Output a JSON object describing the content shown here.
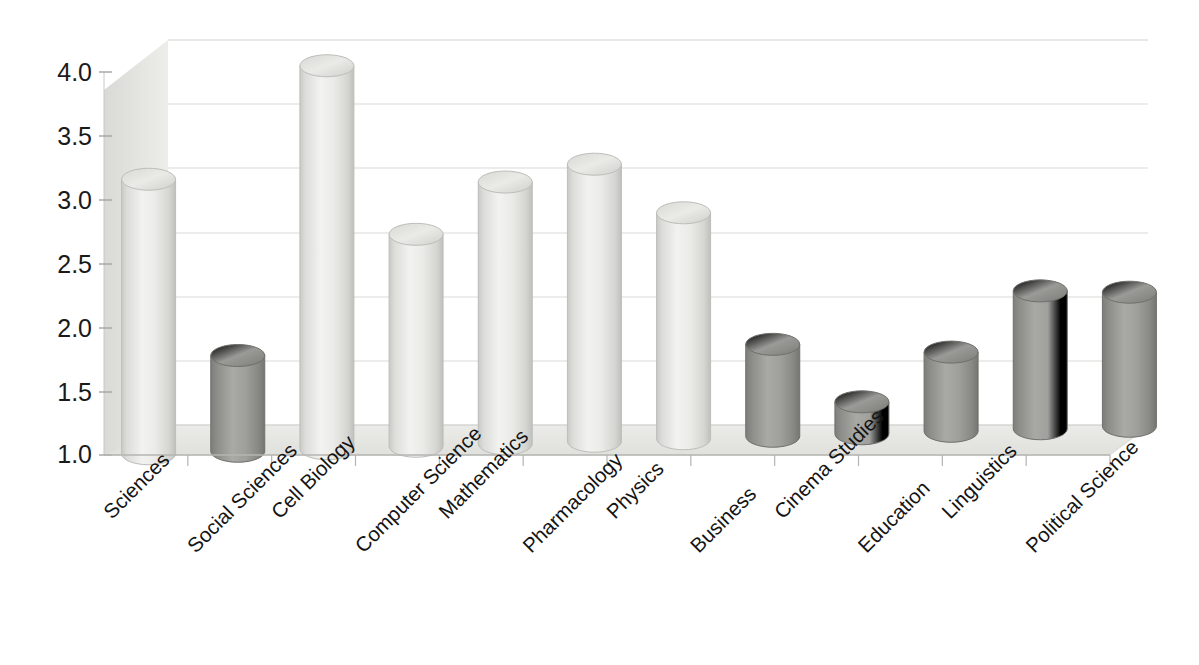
{
  "chart_data": {
    "type": "bar",
    "title": "",
    "subtitle": "",
    "xlabel": "",
    "ylabel": "",
    "ylim": [
      1.0,
      4.0
    ],
    "yticks": [
      "1.0",
      "1.5",
      "2.0",
      "2.5",
      "3.0",
      "3.5",
      "4.0"
    ],
    "ytick_values": [
      1.0,
      1.5,
      2.0,
      2.5,
      3.0,
      3.5,
      4.0
    ],
    "grid": true,
    "legend": "none",
    "style": "3d-cylinder",
    "categories": [
      "Sciences",
      "Social Sciences",
      "Cell Biology",
      "Computer Science",
      "Mathematics",
      "Pharmacology",
      "Physics",
      "Business",
      "Cinema Studies",
      "Education",
      "Linguistics",
      "Political Science"
    ],
    "values": [
      3.15,
      1.75,
      4.0,
      2.66,
      3.05,
      3.17,
      2.77,
      1.72,
      1.25,
      1.62,
      2.08,
      2.05
    ],
    "bar_colors": [
      "#e6e6e3",
      "#9a9a97",
      "#e6e6e3",
      "#e6e6e3",
      "#e6e6e3",
      "#e6e6e3",
      "#e6e6e3",
      "#9a9a97",
      "#9a9a97",
      "#9a9a97",
      "#9a9a97",
      "#9a9a97"
    ],
    "colors": {
      "light_bar": "#e6e6e3",
      "dark_bar": "#9a9a97",
      "gridline": "#d2d2d0",
      "floor": "#eaeae7",
      "wall": "#e4e4e1",
      "axis_text": "#1a1a1a",
      "background": "#ffffff"
    }
  }
}
